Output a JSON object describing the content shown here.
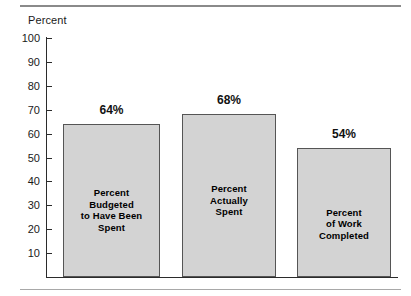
{
  "chart_data": {
    "type": "bar",
    "title": "",
    "subtitle": "",
    "xlabel": "",
    "ylabel": "Percent",
    "ylim": [
      0,
      100
    ],
    "grid": false,
    "legend": "none",
    "y_ticks": [
      "100",
      "90",
      "80",
      "70",
      "60",
      "50",
      "40",
      "30",
      "20",
      "10"
    ],
    "y_tick_values": [
      100,
      90,
      80,
      70,
      60,
      50,
      40,
      30,
      20,
      10
    ],
    "categories": [
      "Percent Budgeted to Have Been Spent",
      "Percent Actually Spent",
      "Percent of Work Completed"
    ],
    "values": [
      64,
      68,
      54
    ],
    "value_labels": [
      "64%",
      "68%",
      "54%"
    ],
    "bars": [
      {
        "value": 64,
        "value_label": "64%",
        "inner_lines": [
          "Percent",
          "Budgeted",
          "to Have Been",
          "Spent"
        ]
      },
      {
        "value": 68,
        "value_label": "68%",
        "inner_lines": [
          "Percent",
          "Actually",
          "Spent"
        ]
      },
      {
        "value": 54,
        "value_label": "54%",
        "inner_lines": [
          "Percent",
          "of Work",
          "Completed"
        ]
      }
    ],
    "colors": {
      "bar_fill": "#d3d3d3",
      "bar_border": "#555555",
      "axis": "#2b2b2b",
      "text": "#111111",
      "rule": "#8a8a8a",
      "background": "#ffffff"
    }
  }
}
